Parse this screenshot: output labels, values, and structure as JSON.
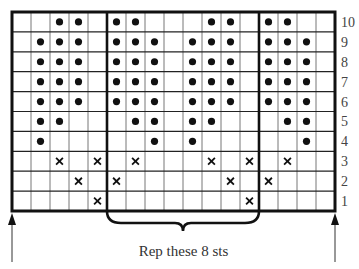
{
  "chart_data": {
    "type": "knitting-chart",
    "columns": 17,
    "rows": 10,
    "row_labels": [
      "10",
      "9",
      "8",
      "7",
      "6",
      "5",
      "4",
      "3",
      "2",
      "1"
    ],
    "repeat": {
      "start_col": 5,
      "end_col": 12,
      "stitches": 8
    },
    "caption": "Rep these 8 sts",
    "legend_symbols": {
      "dot": "purl-bead",
      "x": "cross-stitch"
    },
    "grid": [
      {
        "row": "10",
        "dots": [
          2,
          3,
          5,
          6,
          10,
          11,
          13,
          14
        ],
        "crosses": []
      },
      {
        "row": "9",
        "dots": [
          1,
          2,
          3,
          5,
          6,
          7,
          9,
          10,
          11,
          13,
          14,
          15
        ],
        "crosses": []
      },
      {
        "row": "8",
        "dots": [
          1,
          2,
          3,
          5,
          6,
          7,
          9,
          10,
          11,
          13,
          14,
          15
        ],
        "crosses": []
      },
      {
        "row": "7",
        "dots": [
          1,
          2,
          3,
          5,
          6,
          7,
          9,
          10,
          11,
          13,
          14,
          15
        ],
        "crosses": []
      },
      {
        "row": "6",
        "dots": [
          1,
          2,
          3,
          5,
          6,
          7,
          9,
          10,
          11,
          13,
          14,
          15
        ],
        "crosses": []
      },
      {
        "row": "5",
        "dots": [
          1,
          2,
          6,
          7,
          9,
          10,
          14,
          15
        ],
        "crosses": []
      },
      {
        "row": "4",
        "dots": [
          1,
          7,
          9,
          15
        ],
        "crosses": []
      },
      {
        "row": "3",
        "dots": [],
        "crosses": [
          2,
          4,
          6,
          10,
          12,
          14
        ]
      },
      {
        "row": "2",
        "dots": [],
        "crosses": [
          3,
          5,
          11,
          13
        ]
      },
      {
        "row": "1",
        "dots": [],
        "crosses": [
          4,
          12
        ]
      }
    ],
    "arrows": [
      "left-start",
      "right-start"
    ]
  },
  "colors": {
    "ink": "#111111",
    "grid_line": "#777777",
    "label": "#444444"
  }
}
